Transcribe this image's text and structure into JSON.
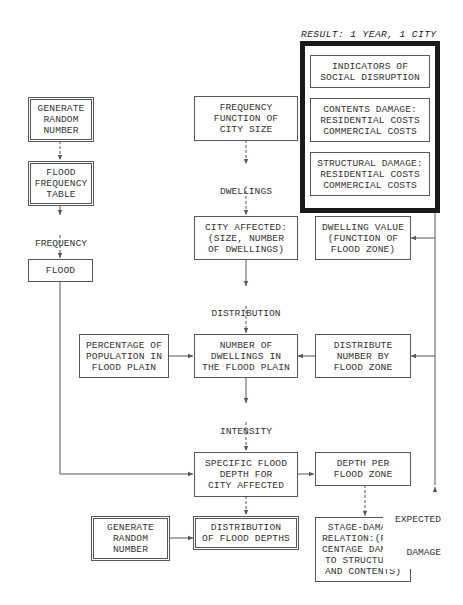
{
  "diagram": {
    "result": {
      "title": "RESULT: 1 YEAR, 1 CITY",
      "boxes": [
        {
          "id": "social",
          "lines": [
            "INDICATORS OF",
            "SOCIAL DISRUPTION"
          ]
        },
        {
          "id": "contents",
          "lines": [
            "CONTENTS DAMAGE:",
            "RESIDENTIAL COSTS",
            "COMMERCIAL COSTS"
          ]
        },
        {
          "id": "structural",
          "lines": [
            "STRUCTURAL DAMAGE:",
            "RESIDENTIAL COSTS",
            "COMMERCIAL COSTS"
          ]
        }
      ]
    },
    "left_column": {
      "generate_random": [
        "GENERATE",
        "RANDOM",
        "NUMBER"
      ],
      "flood_frequency_table": [
        "FLOOD",
        "FREQUENCY",
        "TABLE"
      ],
      "frequency_of_floods": [
        "FREQUENCY",
        "OF FLOODS"
      ],
      "flood": [
        "FLOOD"
      ]
    },
    "center_column": {
      "frequency_function": [
        "FREQUENCY",
        "FUNCTION OF",
        "CITY SIZE"
      ],
      "dwellings_at_risk": [
        "DWELLINGS",
        "AT RISK"
      ],
      "city_affected": [
        "CITY AFFECTED:",
        "(SIZE, NUMBER",
        "OF DWELLINGS)"
      ],
      "distribution_of_dwellings": [
        "DISTRIBUTION",
        "OF DWELLINGS"
      ],
      "number_of_dwellings": [
        "NUMBER OF",
        "DWELLINGS IN",
        "THE FLOOD PLAIN"
      ],
      "intensity_of_floods": [
        "INTENSITY",
        "OF FLOODS"
      ],
      "specific_flood_depth": [
        "SPECIFIC FLOOD",
        "DEPTH FOR",
        "CITY AFFECTED"
      ],
      "distribution_of_flood_depths": [
        "DISTRIBUTION",
        "OF FLOOD DEPTHS"
      ]
    },
    "percentage_population": [
      "PERCENTAGE OF",
      "POPULATION IN",
      "FLOOD PLAIN"
    ],
    "generate_random_2": [
      "GENERATE",
      "RANDOM",
      "NUMBER"
    ],
    "right_column": {
      "dwelling_value": [
        "DWELLING VALUE",
        "(FUNCTION OF",
        "FLOOD ZONE)"
      ],
      "distribute_number": [
        "DISTRIBUTE",
        "NUMBER BY",
        "FLOOD ZONE"
      ],
      "depth_per_zone": [
        "DEPTH PER",
        "FLOOD ZONE"
      ],
      "stage_damage": [
        "STAGE-DAMAGE",
        "RELATION:(PER-",
        "CENTAGE DAMAGE",
        "TO STRUCTURES",
        "AND CONTENTS)"
      ],
      "expected_damage": [
        "EXPECTED",
        "DAMAGE"
      ]
    },
    "colors": {
      "line": "#555555",
      "frame": "#1a1a1a",
      "text": "#333333",
      "background": "#ffffff"
    }
  }
}
